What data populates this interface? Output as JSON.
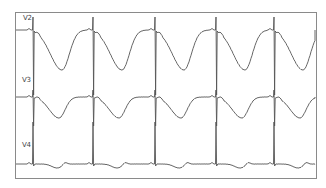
{
  "chart_data": {
    "type": "line",
    "title": "",
    "xlabel": "",
    "ylabel": "",
    "grid": false,
    "legend": "none",
    "frame": {
      "x0": 15,
      "y0": 12,
      "x1": 316,
      "y1": 178
    },
    "colors": {
      "trace": "#555555",
      "frame": "#8a8a8a",
      "background": "#ffffff"
    },
    "qrs_x": [
      33,
      93,
      155,
      216,
      274
    ],
    "series": [
      {
        "name": "V2",
        "label_pos": [
          23,
          14
        ],
        "baseline_y": 30,
        "qrs_top_y": 17,
        "qrs_bottom_y": 95,
        "t_wave_trough_y": 70,
        "t_wave_offset_x": 29,
        "t_wave_width": 36,
        "t_wave_polarity": "inverted"
      },
      {
        "name": "V3",
        "label_pos": [
          22,
          76
        ],
        "baseline_y": 97,
        "qrs_top_y": 90,
        "qrs_bottom_y": 126,
        "t_wave_trough_y": 118,
        "t_wave_offset_x": 26,
        "t_wave_width": 30,
        "t_wave_polarity": "inverted"
      },
      {
        "name": "V4",
        "label_pos": [
          22,
          141
        ],
        "baseline_y": 164,
        "qrs_top_y": 122,
        "qrs_bottom_y": 166,
        "t_wave_trough_y": 168,
        "t_wave_offset_x": 24,
        "t_wave_width": 22,
        "t_wave_polarity": "shallow-inverted"
      }
    ]
  },
  "leads": {
    "v2": "V2",
    "v3": "V3",
    "v4": "V4"
  }
}
